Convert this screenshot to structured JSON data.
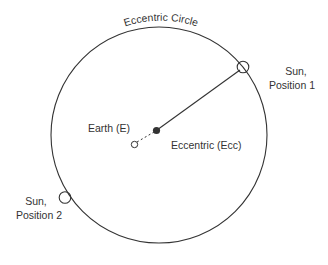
{
  "title": "Eccentric Circle",
  "labels": {
    "earth": "Earth (E)",
    "eccentric": "Eccentric (Ecc)",
    "sun1_line1": "Sun,",
    "sun1_line2": "Position 1",
    "sun2_line1": "Sun,",
    "sun2_line2": "Position 2"
  },
  "colors": {
    "stroke": "#333333",
    "background": "#ffffff"
  }
}
